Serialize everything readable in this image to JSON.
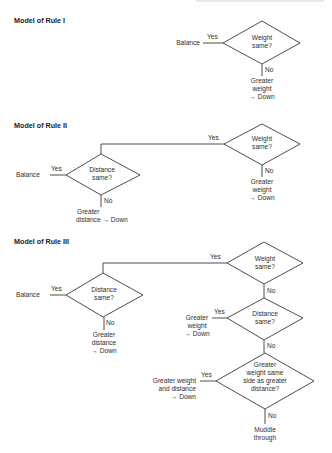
{
  "rules": [
    {
      "title": "Model of Rule I",
      "weight_node": {
        "line1": "Weight",
        "line2": "same?"
      },
      "yes_label": "Yes",
      "no_label": "No",
      "yes_outcome": "Balance",
      "no_outcome": {
        "line1": "Greater",
        "line2": "weight",
        "line3": "→ Down"
      }
    },
    {
      "title": "Model of Rule II",
      "weight_node": {
        "line1": "Weight",
        "line2": "same?"
      },
      "weight_yes_label": "Yes",
      "weight_no_label": "No",
      "weight_no_outcome": {
        "line1": "Greater",
        "line2": "weight",
        "line3": "→ Down"
      },
      "distance_node": {
        "line1": "Distance",
        "line2": "same?"
      },
      "distance_yes_label": "Yes",
      "distance_no_label": "No",
      "distance_yes_outcome": "Balance",
      "distance_no_outcome": {
        "line1": "Greater",
        "line2": "distance  →  Down"
      }
    },
    {
      "title": "Model of Rule III",
      "weight_node": {
        "line1": "Weight",
        "line2": "same?"
      },
      "weight_yes_label": "Yes",
      "weight_no_label": "No",
      "distance_node": {
        "line1": "Distance",
        "line2": "same?"
      },
      "distance_yes_label": "Yes",
      "distance_no_label": "No",
      "distance_yes_outcome": "Balance",
      "distance_no_outcome": {
        "line1": "Greater",
        "line2": "distance",
        "line3": "→ Down"
      },
      "distance2_node": {
        "line1": "Distance",
        "line2": "same?"
      },
      "distance2_yes_label": "Yes",
      "distance2_no_label": "No",
      "distance2_yes_outcome": {
        "line1": "Greater",
        "line2": "weight",
        "line3": "→ Down"
      },
      "conflict_node": {
        "line1": "Greater",
        "line2": "weight same",
        "line3": "side as greater",
        "line4": "distance?"
      },
      "conflict_yes_label": "Yes",
      "conflict_no_label": "No",
      "conflict_yes_outcome": {
        "line1": "Greater weight",
        "line2": "and distance",
        "line3": "→  Down"
      },
      "conflict_no_outcome": {
        "line1": "Muddle",
        "line2": "through"
      }
    }
  ]
}
